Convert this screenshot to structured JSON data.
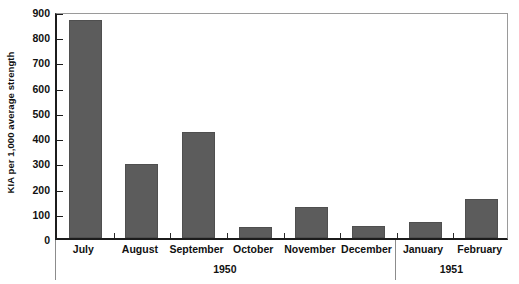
{
  "chart_data": {
    "type": "bar",
    "title": "",
    "subtitle": "",
    "xlabel": "",
    "ylabel": "KIA per 1,000 average strength",
    "ylim": [
      0,
      900
    ],
    "ytick_step": 100,
    "yticks": [
      0,
      100,
      200,
      300,
      400,
      500,
      600,
      700,
      800,
      900
    ],
    "ytick_labels": [
      "0",
      "100",
      "200",
      "300",
      "400",
      "500",
      "600",
      "700",
      "800",
      "900"
    ],
    "grid": false,
    "legend": false,
    "legend_position": "none",
    "categories": [
      "July",
      "August",
      "September",
      "October",
      "November",
      "December",
      "January",
      "February"
    ],
    "values": [
      865,
      292,
      422,
      44,
      123,
      47,
      63,
      153
    ],
    "bar_color": "#5c5c5c",
    "bar_edge_color": "#4f4f4f",
    "axis_color": "#1c1c1c",
    "frame_color": "#9a9a9a",
    "background_color": "#ffffff",
    "groups": [
      {
        "label": "1950",
        "categories": [
          "July",
          "August",
          "September",
          "October",
          "November",
          "December"
        ]
      },
      {
        "label": "1951",
        "categories": [
          "January",
          "February"
        ]
      }
    ],
    "group_labels": [
      "1950",
      "1951"
    ]
  }
}
